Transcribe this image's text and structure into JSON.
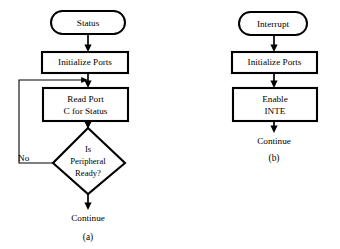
{
  "figure": {
    "background_color": "#ffffff",
    "stroke_color": "#000000"
  },
  "diagram_a": {
    "caption": "(a)",
    "start": {
      "label": "Status",
      "shape": "rounded-terminator"
    },
    "steps": [
      {
        "label": "Initialize Ports",
        "shape": "process"
      },
      {
        "label_line1": "Read Port",
        "label_line2": "C for Status",
        "shape": "process"
      }
    ],
    "decision": {
      "line1": "Is",
      "line2": "Peripheral",
      "line3": "Ready?",
      "shape": "diamond"
    },
    "edge_labels": {
      "no": "No"
    },
    "end": {
      "label": "Continue"
    }
  },
  "diagram_b": {
    "caption": "(b)",
    "start": {
      "label": "Interrupt",
      "shape": "rounded-terminator"
    },
    "steps": [
      {
        "label": "Initialize Ports",
        "shape": "process"
      },
      {
        "label_line1": "Enable",
        "label_line2": "INTE",
        "shape": "process"
      }
    ],
    "end": {
      "label": "Continue"
    }
  }
}
